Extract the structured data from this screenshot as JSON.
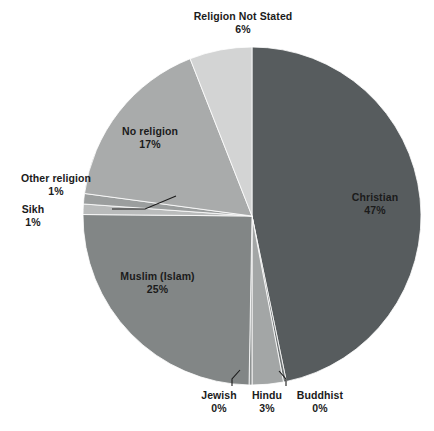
{
  "chart_data": {
    "type": "pie",
    "title": "",
    "subtitle": "",
    "xlabel": "",
    "ylabel": "",
    "legend_position": "none",
    "grid": false,
    "labels_show_percent": true,
    "start_angle_deg": 0,
    "direction": "clockwise",
    "categories": [
      "Christian",
      "Buddhist",
      "Hindu",
      "Jewish",
      "Muslim (Islam)",
      "Sikh",
      "Other religion",
      "No religion",
      "Religion Not Stated"
    ],
    "values": [
      47,
      0,
      3,
      0,
      25,
      1,
      1,
      17,
      6
    ],
    "value_labels": [
      "47%",
      "0%",
      "3%",
      "0%",
      "25%",
      "1%",
      "1%",
      "17%",
      "6%"
    ],
    "colors": [
      "#575c5e",
      "#6e7374",
      "#a3a6a6",
      "#8d9191",
      "#828686",
      "#b9bbbb",
      "#9b9e9e",
      "#a9abab",
      "#d3d4d4"
    ],
    "slices": [
      {
        "name": "Christian",
        "value": 47,
        "value_label": "47%",
        "color": "#575c5e"
      },
      {
        "name": "Buddhist",
        "value": 0,
        "value_label": "0%",
        "color": "#6e7374"
      },
      {
        "name": "Hindu",
        "value": 3,
        "value_label": "3%",
        "color": "#a3a6a6"
      },
      {
        "name": "Jewish",
        "value": 0,
        "value_label": "0%",
        "color": "#8d9191"
      },
      {
        "name": "Muslim (Islam)",
        "value": 25,
        "value_label": "25%",
        "color": "#828686"
      },
      {
        "name": "Sikh",
        "value": 1,
        "value_label": "1%",
        "color": "#b9bbbb"
      },
      {
        "name": "Other religion",
        "value": 1,
        "value_label": "1%",
        "color": "#9b9e9e"
      },
      {
        "name": "No religion",
        "value": 17,
        "value_label": "17%",
        "color": "#a9abab"
      },
      {
        "name": "Religion Not Stated",
        "value": 6,
        "value_label": "6%",
        "color": "#d3d4d4"
      }
    ]
  },
  "labels": {
    "religion_not_stated": {
      "name": "Religion Not Stated",
      "value": "6%"
    },
    "christian": {
      "name": "Christian",
      "value": "47%"
    },
    "no_religion": {
      "name": "No religion",
      "value": "17%"
    },
    "other_religion": {
      "name": "Other religion",
      "value": "1%"
    },
    "sikh": {
      "name": "Sikh",
      "value": "1%"
    },
    "muslim": {
      "name": "Muslim (Islam)",
      "value": "25%"
    },
    "jewish": {
      "name": "Jewish",
      "value": "0%"
    },
    "hindu": {
      "name": "Hindu",
      "value": "3%"
    },
    "buddhist": {
      "name": "Buddhist",
      "value": "0%"
    }
  }
}
